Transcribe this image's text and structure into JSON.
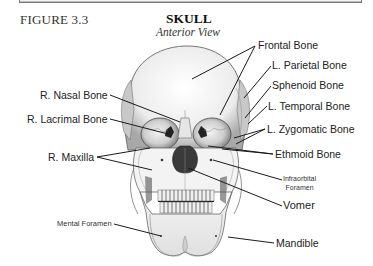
{
  "figure": {
    "number": "FIGURE 3.3",
    "title": "SKULL",
    "subtitle": "Anterior View"
  },
  "labels": {
    "frontal_bone": "Frontal Bone",
    "l_parietal_bone": "L. Parietal Bone",
    "sphenoid_bone": "Sphenoid Bone",
    "l_temporal_bone": "L. Temporal Bone",
    "l_zygomatic_bone": "L. Zygomatic Bone",
    "ethmoid_bone": "Ethmoid Bone",
    "infraorbital_foramen_line1": "Infraorbital",
    "infraorbital_foramen_line2": "Foramen",
    "vomer": "Vomer",
    "mandible": "Mandible",
    "r_nasal_bone": "R. Nasal Bone",
    "r_lacrimal_bone": "R. Lacrimal Bone",
    "r_maxilla": "R. Maxilla",
    "mental_foramen": "Mental Foramen"
  },
  "colors": {
    "bone": "#e9e9e9",
    "shade": "#9a9a9a",
    "outline": "#555555",
    "cavity": "#333333",
    "leader": "#1a1a1a"
  }
}
